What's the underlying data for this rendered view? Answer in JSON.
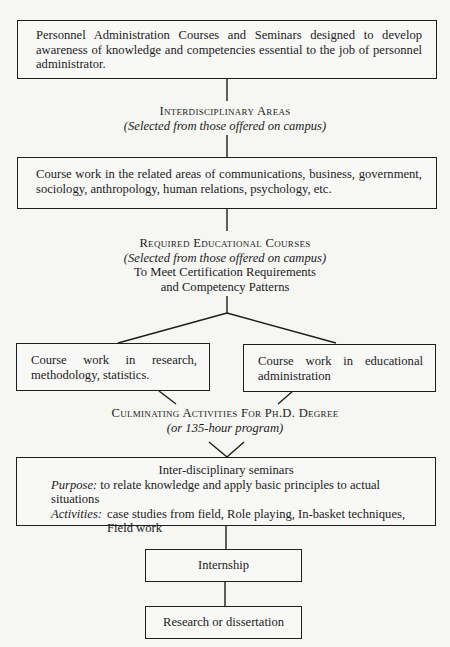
{
  "diagram": {
    "type": "flowchart",
    "nodes": {
      "personnel_courses": {
        "text": "Personnel Administration Courses and Seminars designed to develop awareness of knowledge and competencies essential to the job of personnel administrator."
      },
      "interdisciplinary_label": {
        "title": "Interdisciplinary Areas",
        "subtitle": "(Selected from those offered on campus)"
      },
      "related_areas": {
        "text": "Course work in the related areas of communications, business, government, sociology, anthropology, human relations, psychology, etc."
      },
      "required_label": {
        "title": "Required Educational Courses",
        "subtitle": "(Selected from those offered on campus)",
        "line3": "To Meet Certification Requirements",
        "line4": "and Competency Patterns"
      },
      "research_methods": {
        "text": "Course work in research, methodology, statistics."
      },
      "educational_admin": {
        "text": "Course work in educational administration"
      },
      "culminating_label": {
        "title": "Culminating Activities For Ph.D. Degree",
        "subtitle": "(or 135-hour program)"
      },
      "seminars": {
        "title": "Inter-disciplinary seminars",
        "purpose_key": "Purpose:",
        "purpose_text": "to relate knowledge and apply basic principles to actual situations",
        "activities_key": "Activities:",
        "activities_text": "case studies from field, Role playing, In-basket techniques, Field work"
      },
      "internship": {
        "text": "Internship"
      },
      "research": {
        "text": "Research or dissertation"
      }
    },
    "edges": [
      [
        "personnel_courses",
        "interdisciplinary_label"
      ],
      [
        "interdisciplinary_label",
        "related_areas"
      ],
      [
        "related_areas",
        "required_label"
      ],
      [
        "required_label",
        "research_methods"
      ],
      [
        "required_label",
        "educational_admin"
      ],
      [
        "research_methods",
        "culminating_label"
      ],
      [
        "educational_admin",
        "culminating_label"
      ],
      [
        "culminating_label",
        "seminars"
      ],
      [
        "seminars",
        "internship"
      ],
      [
        "internship",
        "research"
      ]
    ]
  }
}
